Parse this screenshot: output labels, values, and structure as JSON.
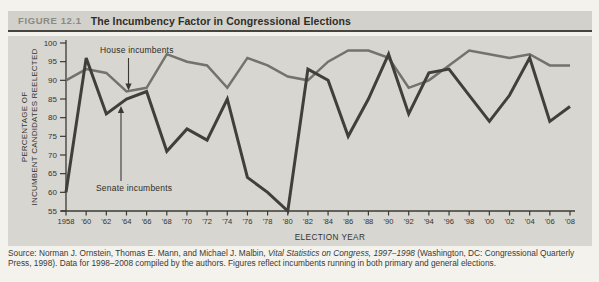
{
  "colors": {
    "page_bg": "#f3f2ed",
    "panel_bg": "#d7d6d0",
    "header_bg": "#d2d1cb",
    "figure_label": "#8b8a82",
    "title_text": "#2e2d28",
    "rule": "#45443d",
    "axis": "#3a3934",
    "tick_text": "#35342f",
    "source_text": "#3b3a34",
    "house_line": "#73726c",
    "senate_line": "#403f3a"
  },
  "header": {
    "figure_label": "FIGURE 12.1",
    "title": "The Incumbency Factor in Congressional Elections"
  },
  "chart_data": {
    "type": "line",
    "title": "The Incumbency Factor in Congressional Elections",
    "xlabel": "ELECTION YEAR",
    "ylabel": "PERCENTAGE OF INCUMBENT CANDIDATES REELECTED",
    "ylabel_lines": [
      "PERCENTAGE OF",
      "INCUMBENT CANDIDATES REELECTED"
    ],
    "x": [
      1958,
      1960,
      1962,
      1964,
      1966,
      1968,
      1970,
      1972,
      1974,
      1976,
      1978,
      1980,
      1982,
      1984,
      1986,
      1988,
      1990,
      1992,
      1994,
      1996,
      1998,
      2000,
      2002,
      2004,
      2006,
      2008
    ],
    "x_tick_labels": [
      "1958",
      "'60",
      "'62",
      "'64",
      "'66",
      "'68",
      "'70",
      "'72",
      "'74",
      "'76",
      "'78",
      "'80",
      "'82",
      "'84",
      "'86",
      "'88",
      "'90",
      "'92",
      "'94",
      "'96",
      "'98",
      "'00",
      "'02",
      "'04",
      "'06",
      "'08"
    ],
    "y_ticks": [
      100,
      95,
      90,
      85,
      80,
      75,
      70,
      65,
      60,
      55
    ],
    "ylim": [
      55,
      100
    ],
    "grid": false,
    "legend_position": "inline-annotations",
    "series": [
      {
        "name": "House incumbents",
        "color": "#73726c",
        "values": [
          90,
          93,
          92,
          87,
          88,
          97,
          95,
          94,
          88,
          96,
          94,
          91,
          90,
          95,
          98,
          98,
          96,
          88,
          90,
          94,
          98,
          97,
          96,
          97,
          94,
          94
        ]
      },
      {
        "name": "Senate incumbents",
        "color": "#403f3a",
        "values": [
          60,
          96,
          81,
          85,
          87,
          71,
          77,
          74,
          85,
          64,
          60,
          55,
          93,
          90,
          75,
          85,
          97,
          81,
          92,
          93,
          86,
          79,
          86,
          96,
          79,
          83
        ]
      }
    ],
    "annotations": [
      {
        "text": "House incumbents",
        "points_to": "house-line"
      },
      {
        "text": "Senate incumbents",
        "points_to": "senate-line"
      }
    ]
  },
  "source": {
    "prefix": "Source: Norman J. Ornstein, Thomas E. Mann, and Michael J. Malbin, ",
    "italic": "Vital Statistics on Congress, 1997–1998",
    "suffix": " (Washington, DC: Congressional Quarterly Press, 1998). Data for 1998–2008 compiled by the authors. Figures reflect incumbents running in both primary and general elections."
  }
}
